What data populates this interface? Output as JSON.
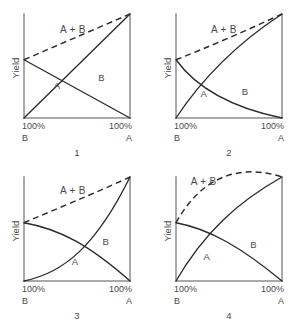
{
  "figure": {
    "title": "",
    "axis_color": "#8d8d8d",
    "curve_color": "#2b2b2b",
    "text_color": "#4a4a4a",
    "background": "#ffffff"
  },
  "labels": {
    "yield": "Yield",
    "sum": "A + B",
    "curve_a": "A",
    "curve_b": "B",
    "tick_left": "100%",
    "tick_right": "100%",
    "pure_left": "B",
    "pure_right": "A"
  },
  "panels": [
    {
      "number": "1",
      "name": "panel-1-linear-additive",
      "description": "Straight-line responses; A + B sum is a straight dashed line",
      "curve_a_path": "M 0 0 L 100 100",
      "curve_b_path": "M 0 56 L 100 0",
      "curve_sum_path": "M 0 56 L 100 100",
      "label_a_pos": [
        28,
        28
      ],
      "label_b_pos": [
        70,
        36
      ],
      "label_sum_pos": [
        34,
        82
      ]
    },
    {
      "number": "2",
      "name": "panel-2-concave-a-convex-b",
      "description": "A rises as a concave curve, B decays convexly; sum nearly linear dashed line",
      "curve_a_path": "M 0 0 C 22 34 55 70 100 100",
      "curve_b_path": "M 0 56 C 20 28 52 10 100 0",
      "curve_sum_path": "M 0 56 C 30 68 64 83 100 100",
      "label_a_pos": [
        23,
        20
      ],
      "label_b_pos": [
        62,
        22
      ],
      "label_sum_pos": [
        33,
        82
      ]
    },
    {
      "number": "3",
      "name": "panel-3-convex-a-concave-b",
      "description": "A rises convexly (slow then steep), B falls concavely; sum dashed nearly linear",
      "curve_a_path": "M 0 0 C 38 8 68 34 100 100",
      "curve_b_path": "M 0 56 C 34 50 62 34 100 0",
      "curve_sum_path": "M 0 56 C 32 70 66 84 100 100",
      "label_a_pos": [
        45,
        15
      ],
      "label_b_pos": [
        74,
        35
      ],
      "label_sum_pos": [
        34,
        84
      ]
    },
    {
      "number": "4",
      "name": "panel-4-synergistic-sum",
      "description": "A rises concavely, B falls convexly, and the dashed A + B curve bulges above both endpoints",
      "curve_a_path": "M 0 0 C 26 46 58 76 100 100",
      "curve_b_path": "M 0 56 C 32 50 62 32 100 0",
      "curve_sum_path": "M 0 56 C 26 104 64 112 100 100",
      "label_a_pos": [
        26,
        20
      ],
      "label_b_pos": [
        70,
        32
      ],
      "label_sum_pos": [
        14,
        92
      ]
    }
  ],
  "chart_data": {
    "type": "line",
    "title": "",
    "xlabel": "",
    "ylabel": "Yield",
    "xlim": [
      0,
      100
    ],
    "ylim": [
      0,
      100
    ],
    "grid": false,
    "legend": "inline-annotations",
    "x_tick_labels": [
      "100% B",
      "100% A"
    ],
    "x_axis_note": "Left end is 100% component B, right end is 100% component A (mixture proportion sweep)",
    "y_axis_note": "Yield, unlabeled magnitude axis",
    "panels": [
      {
        "panel": "1",
        "series": [
          {
            "name": "A",
            "style": "solid",
            "x": [
              0,
              25,
              50,
              75,
              100
            ],
            "values": [
              0,
              25,
              50,
              75,
              100
            ]
          },
          {
            "name": "B",
            "style": "solid",
            "x": [
              0,
              25,
              50,
              75,
              100
            ],
            "values": [
              56,
              42,
              28,
              14,
              0
            ]
          },
          {
            "name": "A + B",
            "style": "dashed",
            "x": [
              0,
              25,
              50,
              75,
              100
            ],
            "values": [
              56,
              67,
              78,
              89,
              100
            ]
          }
        ]
      },
      {
        "panel": "2",
        "series": [
          {
            "name": "A",
            "style": "solid",
            "x": [
              0,
              25,
              50,
              75,
              100
            ],
            "values": [
              0,
              33,
              58,
              80,
              100
            ]
          },
          {
            "name": "B",
            "style": "solid",
            "x": [
              0,
              25,
              50,
              75,
              100
            ],
            "values": [
              56,
              30,
              16,
              7,
              0
            ]
          },
          {
            "name": "A + B",
            "style": "dashed",
            "x": [
              0,
              25,
              50,
              75,
              100
            ],
            "values": [
              56,
              69,
              80,
              90,
              100
            ]
          }
        ]
      },
      {
        "panel": "3",
        "series": [
          {
            "name": "A",
            "style": "solid",
            "x": [
              0,
              25,
              50,
              75,
              100
            ],
            "values": [
              0,
              8,
              24,
              52,
              100
            ]
          },
          {
            "name": "B",
            "style": "solid",
            "x": [
              0,
              25,
              50,
              75,
              100
            ],
            "values": [
              56,
              50,
              40,
              26,
              0
            ]
          },
          {
            "name": "A + B",
            "style": "dashed",
            "x": [
              0,
              25,
              50,
              75,
              100
            ],
            "values": [
              56,
              70,
              82,
              92,
              100
            ]
          }
        ]
      },
      {
        "panel": "4",
        "series": [
          {
            "name": "A",
            "style": "solid",
            "x": [
              0,
              25,
              50,
              75,
              100
            ],
            "values": [
              0,
              44,
              70,
              87,
              100
            ]
          },
          {
            "name": "B",
            "style": "solid",
            "x": [
              0,
              25,
              50,
              75,
              100
            ],
            "values": [
              56,
              50,
              38,
              22,
              0
            ]
          },
          {
            "name": "A + B",
            "style": "dashed",
            "x": [
              0,
              25,
              50,
              75,
              100
            ],
            "values": [
              56,
              94,
              108,
              109,
              100
            ]
          }
        ]
      }
    ]
  }
}
